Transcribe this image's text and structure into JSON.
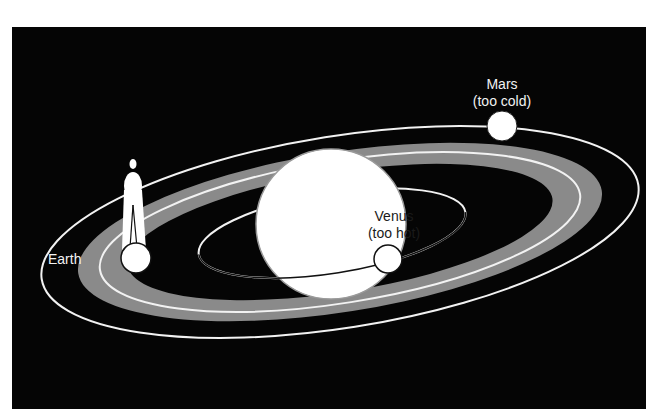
{
  "diagram": {
    "type": "habitable-zone-orbits",
    "colors": {
      "background": "#050505",
      "orbit_line": "#f2f2f2",
      "habitable_zone": "#8a8a8a",
      "sun": "#ffffff",
      "planet": "#ffffff"
    },
    "labels": {
      "earth": "Earth",
      "venus_name": "Venus",
      "venus_note": "(too hot)",
      "mars_name": "Mars",
      "mars_note": "(too cold)"
    },
    "elements": {
      "sun": "sun-icon",
      "human_figure": "person-icon",
      "habitable_zone": "gray band around the Earth orbit"
    }
  }
}
